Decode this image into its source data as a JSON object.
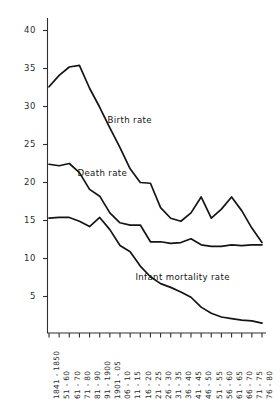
{
  "chart_data": {
    "type": "line",
    "title": "",
    "subtitle": "",
    "xlabel": "",
    "ylabel": "",
    "grid": false,
    "legend_position": "inline-annotations",
    "ylim": [
      0,
      42
    ],
    "yticks": [
      5,
      10,
      15,
      20,
      25,
      30,
      35,
      40
    ],
    "ytick_labels": [
      "5",
      "10",
      "15",
      "20",
      "25",
      "30",
      "35",
      "40"
    ],
    "categories": [
      "1841 - 1850",
      "51 - 60",
      "61 - 70",
      "71 - 80",
      "81 - 90",
      "91 - 1900",
      "1901 - 05",
      "06 - 10",
      "11 - 15",
      "16 - 20",
      "21 - 25",
      "26 - 30",
      "31 - 35",
      "36 - 40",
      "41 - 45",
      "46 - 50",
      "51 - 55",
      "56 - 60",
      "61 - 65",
      "66 - 70",
      "71 - 75",
      "76 - 80"
    ],
    "series": [
      {
        "name": "Birth rate",
        "label_x_frac": 0.28,
        "label_y_value": 28.2,
        "values": [
          32.6,
          34.1,
          35.2,
          35.4,
          32.4,
          29.9,
          27.2,
          24.6,
          21.8,
          20.0,
          19.9,
          16.7,
          15.3,
          14.9,
          16.0,
          18.1,
          15.3,
          16.5,
          18.1,
          16.3,
          14.0,
          12.1
        ]
      },
      {
        "name": "Death rate",
        "label_x_frac": 0.14,
        "label_y_value": 21.2,
        "values": [
          22.4,
          22.2,
          22.5,
          21.3,
          19.1,
          18.2,
          16.0,
          14.7,
          14.4,
          14.4,
          12.2,
          12.2,
          12.0,
          12.1,
          12.6,
          11.8,
          11.6,
          11.6,
          11.8,
          11.7,
          11.8,
          11.8
        ]
      },
      {
        "name": "Infant mortality rate",
        "label_x_frac": 0.41,
        "label_y_value": 7.6,
        "values": [
          15.3,
          15.4,
          15.4,
          14.9,
          14.2,
          15.4,
          13.8,
          11.7,
          10.9,
          9.0,
          7.6,
          6.7,
          6.2,
          5.6,
          4.9,
          3.6,
          2.8,
          2.3,
          2.1,
          1.9,
          1.8,
          1.5
        ]
      }
    ]
  },
  "axes": {
    "axis_color": "#2e2e2e",
    "line_color": "#141414"
  }
}
